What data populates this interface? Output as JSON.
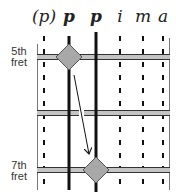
{
  "diagram": {
    "type": "guitar-fretboard-fingering",
    "finger_labels": [
      {
        "label": "(p)",
        "x": 44,
        "style": "dashed"
      },
      {
        "label": "p",
        "x": 69,
        "style": "solid"
      },
      {
        "label": "p",
        "x": 96,
        "style": "solid"
      },
      {
        "label": "i",
        "x": 120,
        "style": "dashed"
      },
      {
        "label": "m",
        "x": 143,
        "style": "dashed"
      },
      {
        "label": "a",
        "x": 163,
        "style": "dashed"
      }
    ],
    "fret_labels": {
      "top_line1": "5th",
      "top_line2": "fret",
      "bottom_line1": "7th",
      "bottom_line2": "fret"
    },
    "markers": [
      {
        "string": "p (1st)",
        "fret": "5th",
        "shape": "diamond"
      },
      {
        "string": "p (2nd)",
        "fret": "7th",
        "shape": "diamond"
      }
    ],
    "arrow": {
      "from": "5th fret diamond",
      "to": "7th fret diamond"
    },
    "colors": {
      "line": "#111111",
      "fret_fill": "#bdbdbd",
      "diamond_fill": "#a8a8a8",
      "diamond_stroke": "#555555"
    }
  }
}
